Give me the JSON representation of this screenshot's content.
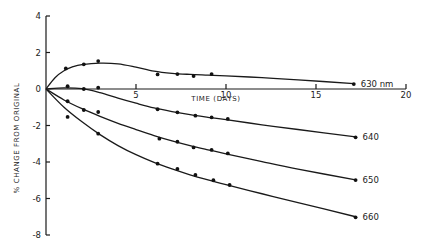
{
  "chart_data": {
    "type": "line",
    "title": "",
    "xlabel": "TIME (DAYS)",
    "ylabel": "% CHANGE FROM ORIGINAL",
    "xlim": [
      0,
      20
    ],
    "ylim": [
      -8,
      4
    ],
    "x_ticks": [
      5,
      10,
      15,
      20
    ],
    "y_ticks": [
      4,
      2,
      0,
      -2,
      -4,
      -6,
      -8
    ],
    "y_tick_labels": [
      "4",
      "2",
      "0",
      "-2",
      "-4",
      "-6",
      "-8"
    ],
    "x_tick_labels": [
      "5",
      "10",
      "15",
      "20"
    ],
    "grid": false,
    "legend": "inline labels at right end of each curve",
    "series": [
      {
        "name": "630 nm",
        "label": "630 nm",
        "points": [
          [
            1.1,
            1.13
          ],
          [
            2.1,
            1.35
          ],
          [
            2.9,
            1.53
          ],
          [
            6.2,
            0.8
          ],
          [
            7.3,
            0.82
          ],
          [
            8.2,
            0.71
          ],
          [
            9.2,
            0.82
          ],
          [
            17.1,
            0.27
          ]
        ],
        "curve": [
          [
            0,
            0
          ],
          [
            0.5,
            0.62
          ],
          [
            1,
            1.0
          ],
          [
            1.5,
            1.22
          ],
          [
            2,
            1.34
          ],
          [
            3,
            1.42
          ],
          [
            4,
            1.38
          ],
          [
            5,
            1.2
          ],
          [
            6,
            0.98
          ],
          [
            7,
            0.86
          ],
          [
            8,
            0.8
          ],
          [
            9,
            0.76
          ],
          [
            10,
            0.72
          ],
          [
            12,
            0.62
          ],
          [
            14,
            0.5
          ],
          [
            17.1,
            0.3
          ]
        ]
      },
      {
        "name": "640",
        "label": "640",
        "points": [
          [
            1.2,
            0.15
          ],
          [
            2.1,
            0.0
          ],
          [
            2.9,
            0.07
          ],
          [
            6.2,
            -1.11
          ],
          [
            7.3,
            -1.28
          ],
          [
            8.3,
            -1.46
          ],
          [
            9.2,
            -1.55
          ],
          [
            10.1,
            -1.64
          ],
          [
            17.2,
            -2.65
          ]
        ],
        "curve": [
          [
            0,
            0
          ],
          [
            1,
            0.06
          ],
          [
            2,
            0.02
          ],
          [
            3,
            -0.2
          ],
          [
            4,
            -0.5
          ],
          [
            5,
            -0.78
          ],
          [
            6,
            -1.04
          ],
          [
            7,
            -1.24
          ],
          [
            8,
            -1.41
          ],
          [
            9,
            -1.55
          ],
          [
            10,
            -1.68
          ],
          [
            12,
            -1.96
          ],
          [
            14,
            -2.22
          ],
          [
            17.2,
            -2.62
          ]
        ]
      },
      {
        "name": "650",
        "label": "650",
        "points": [
          [
            1.2,
            -0.67
          ],
          [
            2.1,
            -1.15
          ],
          [
            2.9,
            -1.26
          ],
          [
            6.3,
            -2.72
          ],
          [
            7.3,
            -2.89
          ],
          [
            8.2,
            -3.2
          ],
          [
            9.2,
            -3.34
          ],
          [
            10.1,
            -3.53
          ],
          [
            17.2,
            -4.99
          ]
        ],
        "curve": [
          [
            0,
            0
          ],
          [
            1,
            -0.6
          ],
          [
            2,
            -1.08
          ],
          [
            3,
            -1.5
          ],
          [
            4,
            -1.88
          ],
          [
            5,
            -2.22
          ],
          [
            6,
            -2.55
          ],
          [
            7,
            -2.84
          ],
          [
            8,
            -3.1
          ],
          [
            9,
            -3.33
          ],
          [
            10,
            -3.55
          ],
          [
            12,
            -3.98
          ],
          [
            14,
            -4.39
          ],
          [
            17.2,
            -4.98
          ]
        ]
      },
      {
        "name": "660",
        "label": "660",
        "points": [
          [
            1.2,
            -1.53
          ],
          [
            2.9,
            -2.45
          ],
          [
            6.2,
            -4.09
          ],
          [
            7.3,
            -4.38
          ],
          [
            8.3,
            -4.71
          ],
          [
            9.3,
            -5.0
          ],
          [
            10.2,
            -5.26
          ],
          [
            17.2,
            -7.03
          ]
        ],
        "curve": [
          [
            0,
            0
          ],
          [
            1,
            -1.0
          ],
          [
            2,
            -1.8
          ],
          [
            3,
            -2.5
          ],
          [
            4,
            -3.1
          ],
          [
            5,
            -3.6
          ],
          [
            6,
            -4.02
          ],
          [
            7,
            -4.38
          ],
          [
            8,
            -4.7
          ],
          [
            9,
            -4.98
          ],
          [
            10,
            -5.24
          ],
          [
            12,
            -5.74
          ],
          [
            14,
            -6.22
          ],
          [
            17.2,
            -7.0
          ]
        ]
      }
    ]
  },
  "axes": {
    "x_title": "TIME (DAYS)",
    "y_title": "% CHANGE FROM ORIGINAL"
  }
}
